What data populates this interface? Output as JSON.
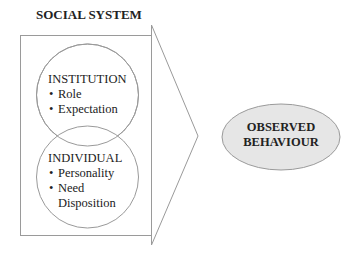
{
  "diagram": {
    "title": "SOCIAL SYSTEM",
    "institution": {
      "heading": "INSTITUTION",
      "items": [
        "Role",
        "Expectation"
      ]
    },
    "individual": {
      "heading": "INDIVIDUAL",
      "items": [
        "Personality",
        "Need"
      ],
      "continuation": "Disposition"
    },
    "outcome": {
      "line1": "OBSERVED",
      "line2": "BEHAVIOUR"
    },
    "colors": {
      "stroke": "#9a9a9a",
      "ellipse_fill": "#e6e6e6",
      "background": "#ffffff"
    }
  }
}
